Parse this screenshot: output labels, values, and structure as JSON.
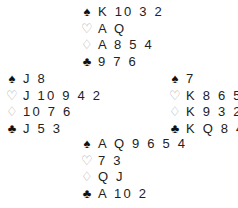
{
  "suits": {
    "spades": "♠",
    "hearts": "♡",
    "diamonds": "♢",
    "clubs": "♣"
  },
  "hands": {
    "north": {
      "spades": "K 10 3 2",
      "hearts": "A Q",
      "diamonds": "A 8 5 4",
      "clubs": "9 7 6"
    },
    "west": {
      "spades": "J 8",
      "hearts": "J 10 9 4 2",
      "diamonds": "10 7 6",
      "clubs": "J 5 3"
    },
    "east": {
      "spades": "7",
      "hearts": "K 8 6 5",
      "diamonds": "K 9 3 2",
      "clubs": "K Q 8 4"
    },
    "south": {
      "spades": "A Q 9 6 5 4",
      "hearts": "7 3",
      "diamonds": "Q J",
      "clubs": "A 10 2"
    }
  }
}
